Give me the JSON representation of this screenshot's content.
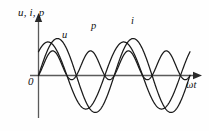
{
  "figure": {
    "kind": "waveform-diagram",
    "background_color": "#fefefe",
    "curve_color": "#1a1a1a",
    "axis_color": "#5a5a5a"
  },
  "labels": {
    "y_axis": "u, i, p",
    "x_axis": "ωt",
    "origin": "0",
    "curve_u": "u",
    "curve_p": "p",
    "curve_i": "i"
  },
  "chart_data": {
    "type": "line",
    "title": "",
    "xlabel": "ωt",
    "ylabel": "u, i, p",
    "grid": false,
    "legend": "inline-curve-labels",
    "axis_style": "arrowed-cartesian",
    "x_unit": "radians",
    "xlim": [
      0,
      12.57
    ],
    "ylim": [
      -1.15,
      1.15
    ],
    "x_tick_labels": [],
    "y_tick_labels": [],
    "annotations": [
      {
        "text": "u",
        "x": 2.3,
        "y": 0.78
      },
      {
        "text": "p",
        "x": 5.1,
        "y": 1.02
      },
      {
        "text": "i",
        "x": 8.2,
        "y": 1.08
      },
      {
        "text": "0",
        "x": 0.0,
        "y": -0.1
      }
    ],
    "series": [
      {
        "name": "u",
        "label": "u",
        "form": "sine",
        "amplitude": 0.78,
        "frequency": 1,
        "phase_deg": 45,
        "description": "voltage sinusoid, leads current"
      },
      {
        "name": "i",
        "label": "i",
        "form": "sine",
        "amplitude": 0.86,
        "frequency": 1,
        "phase_deg": 0,
        "description": "current sinusoid, lags voltage by 45 degrees"
      },
      {
        "name": "p",
        "label": "p",
        "form": "product",
        "amplitude": 1.0,
        "frequency": 2,
        "phase_deg": 45,
        "offset": 0.0,
        "description": "instantaneous power, double frequency, equals u times i"
      }
    ],
    "x": [
      0,
      0.79,
      1.57,
      2.36,
      3.14,
      3.93,
      4.71,
      5.5,
      6.28,
      7.07,
      7.85,
      8.64,
      9.42,
      10.21,
      11.0,
      11.78,
      12.57
    ],
    "u_values": [
      0.55,
      0.78,
      0.55,
      0.0,
      -0.55,
      -0.78,
      -0.55,
      0.0,
      0.55,
      0.78,
      0.55,
      0.0,
      -0.55,
      -0.78,
      -0.55,
      0.0,
      0.55
    ],
    "i_values": [
      0.0,
      0.61,
      0.86,
      0.61,
      0.0,
      -0.61,
      -0.86,
      -0.61,
      0.0,
      0.61,
      0.86,
      0.61,
      0.0,
      -0.61,
      -0.86,
      -0.61,
      0.0
    ],
    "p_values": [
      0.0,
      0.48,
      0.47,
      0.0,
      0.0,
      0.48,
      0.47,
      0.0,
      0.0,
      0.48,
      0.47,
      0.0,
      0.0,
      0.48,
      0.47,
      0.0,
      0.0
    ]
  }
}
